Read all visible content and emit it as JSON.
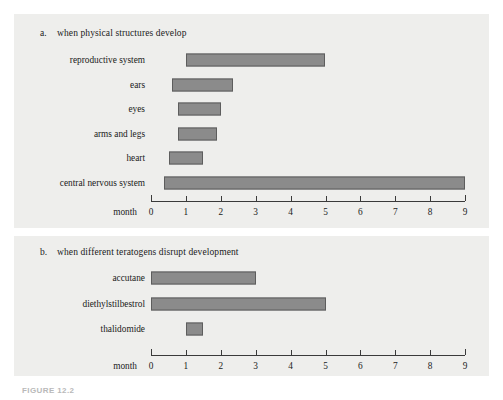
{
  "figure": {
    "caption": "FIGURE 12.2",
    "background_color": "#ffffff",
    "panel_color": "#eeeeec",
    "bar_color": "#8b8b8b",
    "bar_border_color": "#5d5d5d"
  },
  "panels": [
    {
      "marker": "a.",
      "heading": "when physical structures develop"
    },
    {
      "marker": "b.",
      "heading": "when different teratogens disrupt development"
    }
  ],
  "chart_data": [
    {
      "type": "bar",
      "orientation": "horizontal",
      "title": "when physical structures develop",
      "panel": "a",
      "xlabel": "month",
      "ylabel": "",
      "xlim": [
        0,
        9
      ],
      "xticks": [
        0,
        1,
        2,
        3,
        4,
        5,
        6,
        7,
        8,
        9
      ],
      "xtick_labels": [
        "0",
        "1",
        "2",
        "3",
        "4",
        "5",
        "6",
        "7",
        "8",
        "9"
      ],
      "grid": false,
      "legend": "none",
      "categories": [
        "reproductive system",
        "ears",
        "eyes",
        "arms and legs",
        "heart",
        "central nervous system"
      ],
      "ranges": [
        {
          "label": "reproductive system",
          "start": 1.0,
          "end": 5.0
        },
        {
          "label": "ears",
          "start": 0.6,
          "end": 2.35
        },
        {
          "label": "eyes",
          "start": 0.78,
          "end": 2.0
        },
        {
          "label": "arms and legs",
          "start": 0.78,
          "end": 1.9
        },
        {
          "label": "heart",
          "start": 0.52,
          "end": 1.5
        },
        {
          "label": "central nervous system",
          "start": 0.38,
          "end": 9.0
        }
      ]
    },
    {
      "type": "bar",
      "orientation": "horizontal",
      "title": "when different teratogens disrupt development",
      "panel": "b",
      "xlabel": "month",
      "ylabel": "",
      "xlim": [
        0,
        9
      ],
      "xticks": [
        0,
        1,
        2,
        3,
        4,
        5,
        6,
        7,
        8,
        9
      ],
      "xtick_labels": [
        "0",
        "1",
        "2",
        "3",
        "4",
        "5",
        "6",
        "7",
        "8",
        "9"
      ],
      "grid": false,
      "legend": "none",
      "categories": [
        "accutane",
        "diethylstilbestrol",
        "thalidomide"
      ],
      "ranges": [
        {
          "label": "accutane",
          "start": 0.0,
          "end": 3.0
        },
        {
          "label": "diethylstilbestrol",
          "start": 0.0,
          "end": 5.0
        },
        {
          "label": "thalidomide",
          "start": 1.0,
          "end": 1.5
        }
      ]
    }
  ]
}
